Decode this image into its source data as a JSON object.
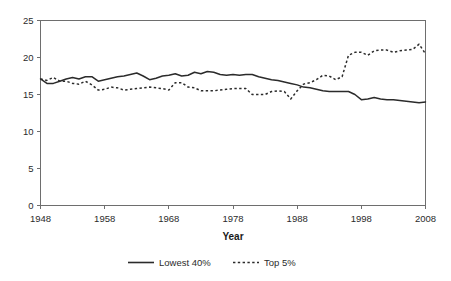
{
  "chart_data": {
    "type": "line",
    "title": "",
    "xlabel": "Year",
    "ylabel": "",
    "xlim": [
      1948,
      2008
    ],
    "ylim": [
      0,
      25
    ],
    "grid": false,
    "legend_position": "bottom",
    "xticks": [
      1948,
      1958,
      1968,
      1978,
      1988,
      1998,
      2008
    ],
    "yticks": [
      0,
      5,
      10,
      15,
      20,
      25
    ],
    "xtick_labels": [
      "1948",
      "1958",
      "1968",
      "1978",
      "1988",
      "1998",
      "2008"
    ],
    "ytick_labels": [
      "0",
      "5",
      "10",
      "15",
      "20",
      "25"
    ],
    "x": [
      1948,
      1949,
      1950,
      1951,
      1952,
      1953,
      1954,
      1955,
      1956,
      1957,
      1958,
      1959,
      1960,
      1961,
      1962,
      1963,
      1964,
      1965,
      1966,
      1967,
      1968,
      1969,
      1970,
      1971,
      1972,
      1973,
      1974,
      1975,
      1976,
      1977,
      1978,
      1979,
      1980,
      1981,
      1982,
      1983,
      1984,
      1985,
      1986,
      1987,
      1988,
      1989,
      1990,
      1991,
      1992,
      1993,
      1994,
      1995,
      1996,
      1997,
      1998,
      1999,
      2000,
      2001,
      2002,
      2003,
      2004,
      2005,
      2006,
      2007,
      2008
    ],
    "series": [
      {
        "name": "Lowest 40%",
        "style": "solid",
        "color": "#2b2b2b",
        "values": [
          17.1,
          16.5,
          16.5,
          16.8,
          17.1,
          17.3,
          17.1,
          17.4,
          17.4,
          16.8,
          17.0,
          17.2,
          17.4,
          17.5,
          17.7,
          17.9,
          17.5,
          17.0,
          17.2,
          17.5,
          17.6,
          17.8,
          17.5,
          17.6,
          18.0,
          17.8,
          18.1,
          18.0,
          17.7,
          17.6,
          17.7,
          17.6,
          17.7,
          17.7,
          17.4,
          17.2,
          17.0,
          16.9,
          16.7,
          16.5,
          16.3,
          16.0,
          15.9,
          15.7,
          15.5,
          15.4,
          15.4,
          15.4,
          15.4,
          15.0,
          14.3,
          14.4,
          14.6,
          14.4,
          14.3,
          14.3,
          14.2,
          14.1,
          14.0,
          13.9,
          14.0
        ]
      },
      {
        "name": "Top 5%",
        "style": "dotted",
        "color": "#2b2b2b",
        "values": [
          17.1,
          16.9,
          17.3,
          16.8,
          16.8,
          16.5,
          16.4,
          16.8,
          16.3,
          15.6,
          15.7,
          16.0,
          15.9,
          15.6,
          15.7,
          15.8,
          15.9,
          16.0,
          15.9,
          15.8,
          15.6,
          16.6,
          16.6,
          16.0,
          15.9,
          15.5,
          15.5,
          15.5,
          15.6,
          15.7,
          15.8,
          15.8,
          15.8,
          15.0,
          15.0,
          15.0,
          15.4,
          15.5,
          15.4,
          14.4,
          15.5,
          16.4,
          16.6,
          17.0,
          17.6,
          17.5,
          17.0,
          17.4,
          20.3,
          20.7,
          20.7,
          20.3,
          20.9,
          21.0,
          21.0,
          20.7,
          20.9,
          21.0,
          21.1,
          21.8,
          20.5
        ]
      }
    ]
  },
  "legend": {
    "items": [
      {
        "label": "Lowest 40%",
        "style": "solid"
      },
      {
        "label": "Top 5%",
        "style": "dotted"
      }
    ]
  },
  "axes": {
    "x_title": "Year"
  },
  "colors": {
    "line": "#2b2b2b",
    "axis": "#6e6e6e",
    "background": "#ffffff"
  }
}
